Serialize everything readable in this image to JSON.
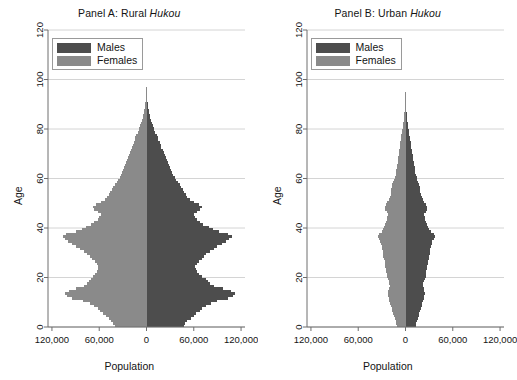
{
  "figure": {
    "width": 517,
    "height": 380,
    "background": "#ffffff"
  },
  "colors": {
    "males": "#4d4d4d",
    "females": "#8a8a8a",
    "axis": "#6e6e6e",
    "grid": "#c9c9c9",
    "text": "#141414",
    "legend_border": "#9a9a9a"
  },
  "panels": [
    {
      "id": "panel-a",
      "title_prefix": "Panel A: Rural ",
      "title_italic": "Hukou",
      "title_full": "Panel A: Rural Hukou"
    },
    {
      "id": "panel-b",
      "title_prefix": "Panel B: Urban ",
      "title_italic": "Hukou",
      "title_full": "Panel B: Urban Hukou"
    }
  ],
  "legend": {
    "items": [
      {
        "label": "Males",
        "color": "#4d4d4d"
      },
      {
        "label": "Females",
        "color": "#8a8a8a"
      }
    ]
  },
  "axes": {
    "x": {
      "label": "Population",
      "ticks": [
        -120000,
        -60000,
        0,
        60000,
        120000
      ],
      "tick_labels": [
        "120,000",
        "60,000",
        "0",
        "60,000",
        "120,000"
      ],
      "min": -125000,
      "max": 125000
    },
    "y": {
      "label": "Age",
      "ticks": [
        0,
        20,
        40,
        60,
        80,
        100,
        120
      ],
      "tick_labels": [
        "0",
        "20",
        "40",
        "60",
        "80",
        "100",
        "120"
      ],
      "min": 0,
      "max": 120,
      "grid": true
    }
  },
  "chart_data": {
    "type": "bar",
    "subtype": "population-pyramid",
    "xlabel": "Population",
    "ylabel": "Age",
    "xlim": [
      -125000,
      125000
    ],
    "ylim": [
      0,
      120
    ],
    "grid": true,
    "legend_position": "top-left",
    "bar_unit_age": 1,
    "note": "Male counts plotted to the right of zero, female counts to the left (shown as absolute values on the axis).",
    "panels": [
      {
        "name": "Panel A: Rural Hukou",
        "ages": [
          0,
          1,
          2,
          3,
          4,
          5,
          6,
          7,
          8,
          9,
          10,
          11,
          12,
          13,
          14,
          15,
          16,
          17,
          18,
          19,
          20,
          21,
          22,
          23,
          24,
          25,
          26,
          27,
          28,
          29,
          30,
          31,
          32,
          33,
          34,
          35,
          36,
          37,
          38,
          39,
          40,
          41,
          42,
          43,
          44,
          45,
          46,
          47,
          48,
          49,
          50,
          51,
          52,
          53,
          54,
          55,
          56,
          57,
          58,
          59,
          60,
          61,
          62,
          63,
          64,
          65,
          66,
          67,
          68,
          69,
          70,
          71,
          72,
          73,
          74,
          75,
          76,
          77,
          78,
          79,
          80,
          81,
          82,
          83,
          84,
          85,
          86,
          87,
          88,
          89,
          90,
          91,
          92,
          93,
          94,
          95,
          96,
          97,
          98,
          99,
          100,
          101,
          102,
          103,
          104,
          105,
          106,
          107,
          108,
          109,
          110
        ],
        "series": [
          {
            "name": "Males",
            "color": "#4d4d4d",
            "values": [
              47000,
              49000,
              52000,
              56000,
              60000,
              63000,
              68000,
              71000,
              76000,
              82000,
              90000,
              104000,
              110000,
              112000,
              107000,
              97000,
              86000,
              81000,
              78000,
              75000,
              71000,
              67000,
              64000,
              63000,
              62000,
              64000,
              66000,
              70000,
              73000,
              76000,
              80000,
              86000,
              90000,
              96000,
              101000,
              105000,
              108000,
              104000,
              92000,
              84000,
              79000,
              72000,
              68000,
              64000,
              62000,
              60000,
              64000,
              68000,
              70000,
              66000,
              60000,
              55000,
              52000,
              50000,
              48000,
              46000,
              44000,
              42000,
              40000,
              38000,
              36000,
              34000,
              32000,
              31000,
              30000,
              28000,
              27000,
              26000,
              25000,
              23000,
              22000,
              21000,
              19000,
              18000,
              17000,
              15000,
              14000,
              13000,
              11000,
              10000,
              9000,
              8000,
              7000,
              6000,
              5000,
              4200,
              3500,
              2900,
              2300,
              1800,
              1400,
              1050,
              800,
              600,
              440,
              320,
              230,
              160,
              110,
              75,
              50,
              34,
              22,
              14,
              9,
              6,
              4,
              2,
              1,
              1,
              0
            ]
          },
          {
            "name": "Females",
            "color": "#8a8a8a",
            "values": [
              40000,
              42000,
              45000,
              48000,
              52000,
              55000,
              59000,
              62000,
              67000,
              72000,
              80000,
              95000,
              101000,
              103000,
              98000,
              89000,
              79000,
              75000,
              73000,
              71000,
              68000,
              65000,
              63000,
              62000,
              61000,
              63000,
              65000,
              69000,
              72000,
              75000,
              79000,
              85000,
              89000,
              95000,
              99000,
              103000,
              106000,
              102000,
              90000,
              82000,
              77000,
              70000,
              66000,
              62000,
              60000,
              58000,
              62000,
              66000,
              68000,
              64000,
              58000,
              53000,
              50000,
              48000,
              46000,
              44000,
              42000,
              40000,
              38000,
              36000,
              34000,
              32000,
              31000,
              30000,
              29000,
              27000,
              26000,
              25000,
              24000,
              22000,
              21000,
              20000,
              18000,
              17000,
              16000,
              15000,
              14000,
              13000,
              11000,
              10000,
              9000,
              8000,
              7000,
              6000,
              5000,
              4300,
              3600,
              3000,
              2400,
              1900,
              1500,
              1150,
              880,
              660,
              490,
              360,
              260,
              185,
              130,
              88,
              60,
              40,
              26,
              17,
              11,
              7,
              5,
              3,
              2,
              1,
              1
            ]
          }
        ]
      },
      {
        "name": "Panel B: Urban Hukou",
        "ages": [
          0,
          1,
          2,
          3,
          4,
          5,
          6,
          7,
          8,
          9,
          10,
          11,
          12,
          13,
          14,
          15,
          16,
          17,
          18,
          19,
          20,
          21,
          22,
          23,
          24,
          25,
          26,
          27,
          28,
          29,
          30,
          31,
          32,
          33,
          34,
          35,
          36,
          37,
          38,
          39,
          40,
          41,
          42,
          43,
          44,
          45,
          46,
          47,
          48,
          49,
          50,
          51,
          52,
          53,
          54,
          55,
          56,
          57,
          58,
          59,
          60,
          61,
          62,
          63,
          64,
          65,
          66,
          67,
          68,
          69,
          70,
          71,
          72,
          73,
          74,
          75,
          76,
          77,
          78,
          79,
          80,
          81,
          82,
          83,
          84,
          85,
          86,
          87,
          88,
          89,
          90,
          91,
          92,
          93,
          94,
          95,
          96,
          97,
          98,
          99,
          100,
          101,
          102,
          103,
          104,
          105,
          106,
          107,
          108,
          109,
          110
        ],
        "series": [
          {
            "name": "Males",
            "color": "#4d4d4d",
            "values": [
              13000,
              13500,
              14500,
              15500,
              16500,
              17500,
              18500,
              19500,
              20500,
              21500,
              22500,
              23500,
              24000,
              24500,
              24000,
              23000,
              22000,
              22500,
              23500,
              24500,
              25500,
              26000,
              26500,
              27000,
              27500,
              28000,
              28500,
              29500,
              30000,
              30500,
              31000,
              31500,
              32000,
              33000,
              34000,
              36000,
              37000,
              36000,
              32000,
              30000,
              29000,
              27000,
              26000,
              25000,
              24500,
              24000,
              25500,
              27000,
              27500,
              26000,
              24000,
              22000,
              21000,
              20000,
              19000,
              18500,
              18000,
              17000,
              16000,
              15000,
              14000,
              13000,
              12500,
              12000,
              11500,
              11000,
              10500,
              10000,
              9500,
              9000,
              8500,
              8000,
              7500,
              7000,
              6500,
              6000,
              5500,
              5000,
              4500,
              4000,
              3600,
              3200,
              2800,
              2400,
              2000,
              1700,
              1400,
              1150,
              900,
              720,
              560,
              430,
              320,
              240,
              175,
              128,
              92,
              64,
              44,
              30,
              20,
              13,
              9,
              6,
              4,
              2,
              1,
              1,
              0,
              0
            ]
          },
          {
            "name": "Females",
            "color": "#8a8a8a",
            "values": [
              11000,
              11500,
              12500,
              13500,
              14500,
              15500,
              16500,
              17500,
              18500,
              19500,
              20500,
              21500,
              22000,
              22500,
              22000,
              21000,
              20000,
              20500,
              21500,
              22500,
              23500,
              24000,
              24500,
              25000,
              25500,
              26000,
              26500,
              27500,
              28000,
              28500,
              29000,
              29500,
              30000,
              31000,
              32000,
              34000,
              35000,
              34000,
              30000,
              28500,
              27500,
              25500,
              24500,
              23500,
              23000,
              22500,
              24000,
              25500,
              26000,
              24500,
              23000,
              21000,
              20000,
              19000,
              18500,
              18000,
              17500,
              16500,
              15500,
              14500,
              13500,
              12500,
              12000,
              11500,
              11000,
              10500,
              10000,
              9600,
              9200,
              8800,
              8400,
              8000,
              7500,
              7000,
              6500,
              6100,
              5600,
              5100,
              4600,
              4100,
              3700,
              3300,
              2900,
              2500,
              2100,
              1800,
              1500,
              1250,
              1000,
              800,
              630,
              480,
              360,
              270,
              198,
              145,
              105,
              74,
              51,
              35,
              24,
              16,
              11,
              7,
              5,
              3,
              2,
              1,
              1,
              0
            ]
          }
        ]
      }
    ]
  }
}
